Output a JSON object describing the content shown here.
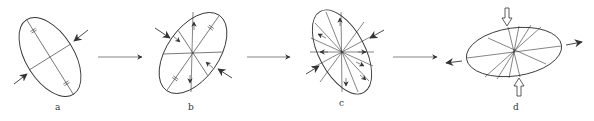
{
  "diagram": {
    "type": "deformation-sequence",
    "colors": {
      "stroke": "#333333",
      "background": "#ffffff"
    },
    "panels": [
      {
        "id": "a",
        "label": "a",
        "description": "Ellipse with two perpendicular axes, tick marks on long axis, compression arrows at ends of short axis"
      },
      {
        "id": "b",
        "label": "b",
        "description": "Rotated ellipse with several radial lines, tick marks and small shear arrows, compression arrows"
      },
      {
        "id": "c",
        "label": "c",
        "description": "Ellipse with many radial lines and small shear arrows, compression arrows"
      },
      {
        "id": "d",
        "label": "d",
        "description": "Flattened horizontal ellipse with fan of radial lines, hollow vertical compression arrows and solid horizontal extension arrows"
      }
    ],
    "transitions": [
      {
        "from": "a",
        "to": "b",
        "icon": "arrow-right-icon"
      },
      {
        "from": "b",
        "to": "c",
        "icon": "arrow-right-icon"
      },
      {
        "from": "c",
        "to": "d",
        "icon": "arrow-right-icon"
      }
    ]
  }
}
